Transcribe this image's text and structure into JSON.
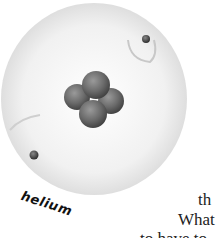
{
  "figure": {
    "label": "helium",
    "nucleus_particles": 4,
    "electrons": 2
  },
  "body_text": {
    "line1": "th",
    "line2": "What",
    "line3": "to have to"
  },
  "colors": {
    "cloud": "#ececec",
    "nucleus": "#6e6e6e",
    "electron": "#4a4a4a"
  }
}
